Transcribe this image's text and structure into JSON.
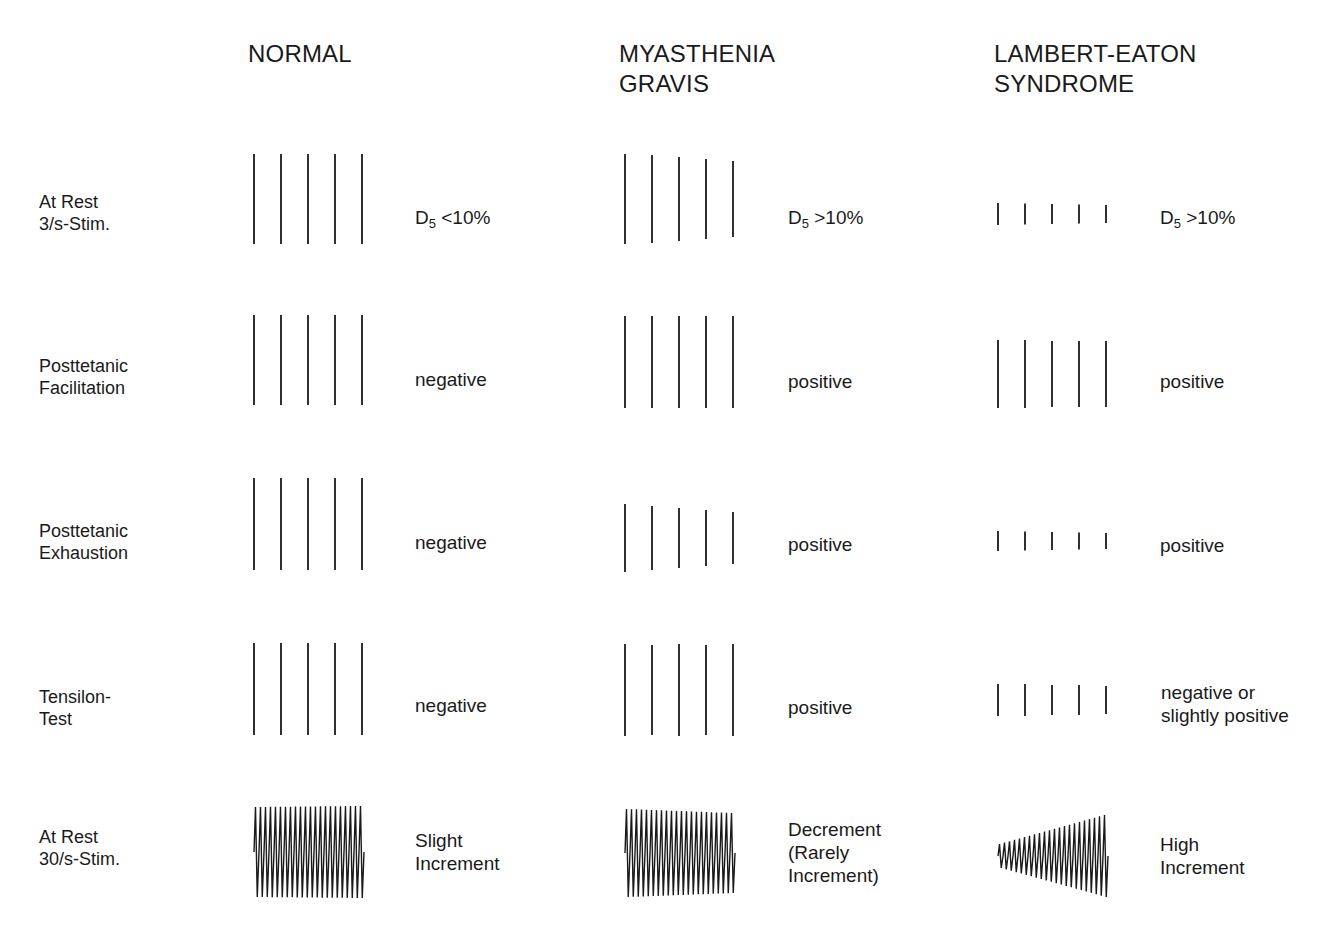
{
  "columns": [
    {
      "id": "normal",
      "title_line1": "NORMAL",
      "title_line2": ""
    },
    {
      "id": "mg",
      "title_line1": "MYASTHENIA",
      "title_line2": "GRAVIS"
    },
    {
      "id": "les",
      "title_line1": "LAMBERT-EATON",
      "title_line2": "SYNDROME"
    }
  ],
  "rows": [
    {
      "id": "rest3",
      "label_line1": "At Rest",
      "label_line2": "3/s-Stim."
    },
    {
      "id": "ptf",
      "label_line1": "Posttetanic",
      "label_line2": "Facilitation"
    },
    {
      "id": "pte",
      "label_line1": "Posttetanic",
      "label_line2": "Exhaustion"
    },
    {
      "id": "tensilon",
      "label_line1": "Tensilon-",
      "label_line2": "Test"
    },
    {
      "id": "rest30",
      "label_line1": "At Rest",
      "label_line2": "30/s-Stim."
    }
  ],
  "results": {
    "normal": {
      "rest3": {
        "prefix": "D",
        "sub": "5",
        "text": " <10%"
      },
      "ptf": {
        "line1": "negative"
      },
      "pte": {
        "line1": "negative"
      },
      "tensilon": {
        "line1": "negative"
      },
      "rest30": {
        "line1": "Slight",
        "line2": "Increment"
      }
    },
    "mg": {
      "rest3": {
        "prefix": "D",
        "sub": "5",
        "text": " >10%"
      },
      "ptf": {
        "line1": "positive"
      },
      "pte": {
        "line1": "positive"
      },
      "tensilon": {
        "line1": "positive"
      },
      "rest30": {
        "line1": "Decrement",
        "line2": "(Rarely",
        "line3": "Increment)"
      }
    },
    "les": {
      "rest3": {
        "prefix": "D",
        "sub": "5",
        "text": " >10%"
      },
      "ptf": {
        "line1": "positive"
      },
      "pte": {
        "line1": "positive"
      },
      "tensilon": {
        "line1": "negative or",
        "line2": "slightly positive"
      },
      "rest30": {
        "line1": "High",
        "line2": "Increment"
      }
    }
  },
  "traces": {
    "stroke_color": "#1a1a1a",
    "bar_spacing_px": 27,
    "normal": {
      "rest3": {
        "x": 254,
        "heights": [
          90,
          90,
          90,
          90,
          90
        ],
        "center_y": 199
      },
      "ptf": {
        "x": 254,
        "heights": [
          90,
          90,
          90,
          90,
          90
        ],
        "center_y": 360
      },
      "pte": {
        "x": 254,
        "heights": [
          92,
          92,
          92,
          92,
          92
        ],
        "center_y": 524
      },
      "tensilon": {
        "x": 254,
        "heights": [
          92,
          92,
          92,
          92,
          92
        ],
        "center_y": 689
      },
      "rest30": {
        "x": 254,
        "count": 22,
        "start_height": 90,
        "end_height": 92,
        "center_y": 852
      }
    },
    "mg": {
      "rest3": {
        "x": 625,
        "heights": [
          90,
          88,
          84,
          80,
          76
        ],
        "center_y": 199
      },
      "ptf": {
        "x": 625,
        "heights": [
          92,
          92,
          92,
          92,
          92
        ],
        "center_y": 362
      },
      "pte": {
        "x": 625,
        "heights": [
          68,
          64,
          60,
          56,
          52
        ],
        "center_y": 538
      },
      "tensilon": {
        "x": 625,
        "heights": [
          92,
          90,
          92,
          90,
          92
        ],
        "center_y": 690
      },
      "rest30": {
        "x": 625,
        "count": 22,
        "start_height": 88,
        "end_height": 80,
        "center_y": 853
      }
    },
    "les": {
      "rest3": {
        "x": 998,
        "heights": [
          22,
          21,
          20,
          19,
          18
        ],
        "center_y": 214
      },
      "ptf": {
        "x": 998,
        "heights": [
          68,
          68,
          66,
          66,
          66
        ],
        "center_y": 374
      },
      "pte": {
        "x": 998,
        "heights": [
          20,
          19,
          18,
          17,
          16
        ],
        "center_y": 541
      },
      "tensilon": {
        "x": 998,
        "heights": [
          32,
          32,
          30,
          30,
          28
        ],
        "center_y": 700
      },
      "rest30": {
        "x": 998,
        "count": 22,
        "start_height": 24,
        "end_height": 82,
        "center_y": 856
      }
    }
  }
}
